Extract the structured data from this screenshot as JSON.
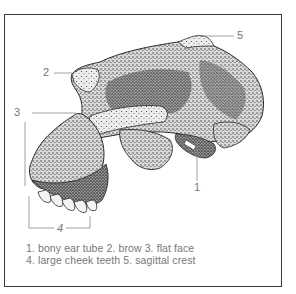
{
  "figure": {
    "callouts": [
      {
        "number": "1",
        "label": "bony ear tube"
      },
      {
        "number": "2",
        "label": "brow"
      },
      {
        "number": "3",
        "label": "flat face"
      },
      {
        "number": "4",
        "label": "large cheek teeth"
      },
      {
        "number": "5",
        "label": "sagittal crest"
      }
    ],
    "caption": {
      "line1": "1. bony ear tube 2. brow 3. flat face",
      "line2": "4. large cheek teeth 5. sagittal crest"
    }
  },
  "labels": {
    "n1": "1",
    "n2": "2",
    "n3": "3",
    "n4": "4",
    "n5": "5"
  },
  "colors": {
    "frame": "#3a3a3a",
    "leader_lines": "#888888",
    "text": "#777777",
    "ink": "#2b2b2b"
  }
}
